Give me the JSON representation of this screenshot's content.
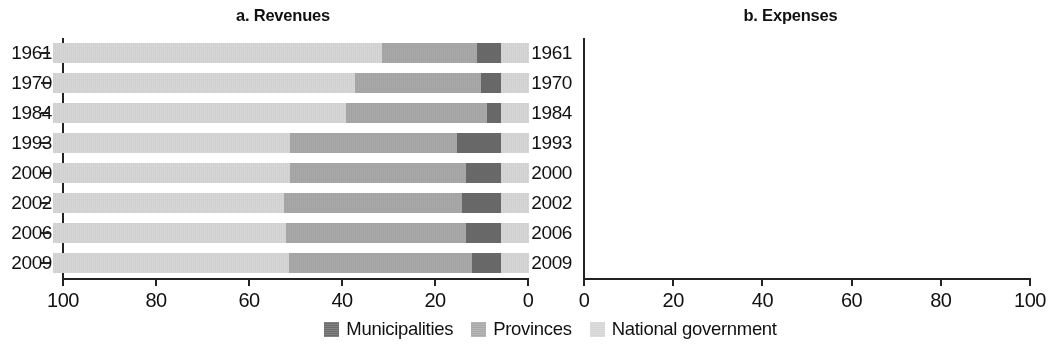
{
  "figure": {
    "panels": [
      {
        "key": "a",
        "title": "a. Revenues"
      },
      {
        "key": "b",
        "title": "b. Expenses"
      }
    ],
    "legend": [
      {
        "name": "municipalities",
        "label": "Municipalities",
        "color": "#6a6a6a"
      },
      {
        "name": "provinces",
        "label": "Provinces",
        "color": "#a8a8a8"
      },
      {
        "name": "national-government",
        "label": "National government",
        "color": "#d6d6d6"
      }
    ]
  },
  "chart_data": [
    {
      "type": "bar",
      "title": "a. Revenues",
      "orientation": "horizontal",
      "stacked": true,
      "stack_total": 100,
      "xlabel": "",
      "ylabel": "",
      "xlim": [
        100,
        0
      ],
      "x_reversed": true,
      "xticks": [
        100,
        80,
        60,
        40,
        20,
        0
      ],
      "xticklabels": [
        "100",
        "80",
        "60",
        "40",
        "20",
        "0"
      ],
      "grid": false,
      "legend_position": "bottom-center",
      "categories": [
        "1961",
        "1970",
        "1984",
        "1993",
        "2000",
        "2002",
        "2006",
        "2009"
      ],
      "series": [
        {
          "name": "Municipalities",
          "color": "#6a6a6a",
          "values": [
            6.3,
            4.9,
            5.6,
            5.8,
            5.6,
            5.8,
            5.4,
            5.4
          ]
        },
        {
          "name": "Provinces",
          "color": "#a8a8a8",
          "values": [
            24.4,
            27.5,
            26.4,
            18.5,
            18.1,
            19.6,
            16.5,
            14.6
          ]
        },
        {
          "name": "National government",
          "color": "#d6d6d6",
          "values": [
            69.3,
            67.6,
            68.0,
            75.7,
            76.3,
            74.6,
            78.1,
            80.0
          ]
        }
      ]
    },
    {
      "type": "bar",
      "title": "b. Expenses",
      "orientation": "horizontal",
      "stacked": true,
      "stack_total": 100,
      "xlabel": "",
      "ylabel": "",
      "xlim": [
        0,
        100
      ],
      "x_reversed": false,
      "xticks": [
        0,
        20,
        40,
        60,
        80,
        100
      ],
      "xticklabels": [
        "0",
        "20",
        "40",
        "60",
        "80",
        "100"
      ],
      "grid": false,
      "legend_position": "bottom-center",
      "categories": [
        "1961",
        "1970",
        "1984",
        "1993",
        "2000",
        "2002",
        "2006",
        "2009"
      ],
      "series": [
        {
          "name": "National government",
          "color": "#d6d6d6",
          "values": [
            73.4,
            67.5,
            65.3,
            53.0,
            53.0,
            51.5,
            51.9,
            52.6
          ]
        },
        {
          "name": "Provinces",
          "color": "#a8a8a8",
          "values": [
            21.2,
            28.0,
            31.6,
            37.2,
            39.2,
            39.8,
            40.3,
            40.9
          ]
        },
        {
          "name": "Municipalities",
          "color": "#6a6a6a",
          "values": [
            5.4,
            4.5,
            3.1,
            9.8,
            7.8,
            8.7,
            7.8,
            6.5
          ]
        }
      ]
    }
  ]
}
